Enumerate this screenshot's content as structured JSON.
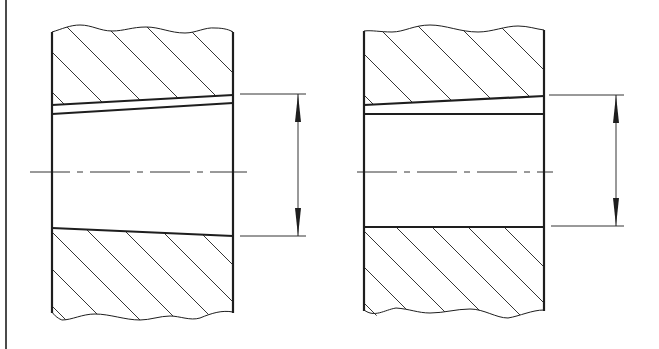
{
  "diagram": {
    "type": "engineering-section-drawing",
    "colors": {
      "line": "#1e1e1e",
      "background": "#ffffff"
    },
    "frame_line": {
      "x": 6,
      "y1": 0,
      "y2": 349
    },
    "views": [
      {
        "id": "left",
        "body": {
          "x1": 52,
          "x2": 233,
          "top": 31,
          "bottom": 313
        },
        "bore_top_outer": {
          "from": [
            52,
            105
          ],
          "to": [
            233,
            95
          ]
        },
        "bore_top_inner": {
          "from": [
            52,
            114
          ],
          "to": [
            233,
            103
          ]
        },
        "bore_bottom": {
          "from": [
            52,
            228
          ],
          "to": [
            233,
            236
          ]
        },
        "centerline": {
          "y": 172,
          "x1": 30,
          "x2": 247
        },
        "dimension": {
          "x": 298,
          "y_top": 94,
          "y_bottom": 236,
          "ext_x1": 240,
          "ext_x2": 306
        }
      },
      {
        "id": "right",
        "body": {
          "x1": 364,
          "x2": 544,
          "top": 30,
          "bottom": 311
        },
        "bore_top_outer": {
          "from": [
            364,
            105
          ],
          "to": [
            544,
            96
          ]
        },
        "bore_top_inner": {
          "from": [
            364,
            114
          ],
          "to": [
            544,
            114
          ]
        },
        "bore_bottom": {
          "from": [
            364,
            227
          ],
          "to": [
            544,
            227
          ]
        },
        "centerline": {
          "y": 172,
          "x1": 357,
          "x2": 553
        },
        "dimension": {
          "x": 616,
          "y_top": 95,
          "y_bottom": 226,
          "ext_x1": 549,
          "ext_x2": 624
        }
      }
    ]
  }
}
